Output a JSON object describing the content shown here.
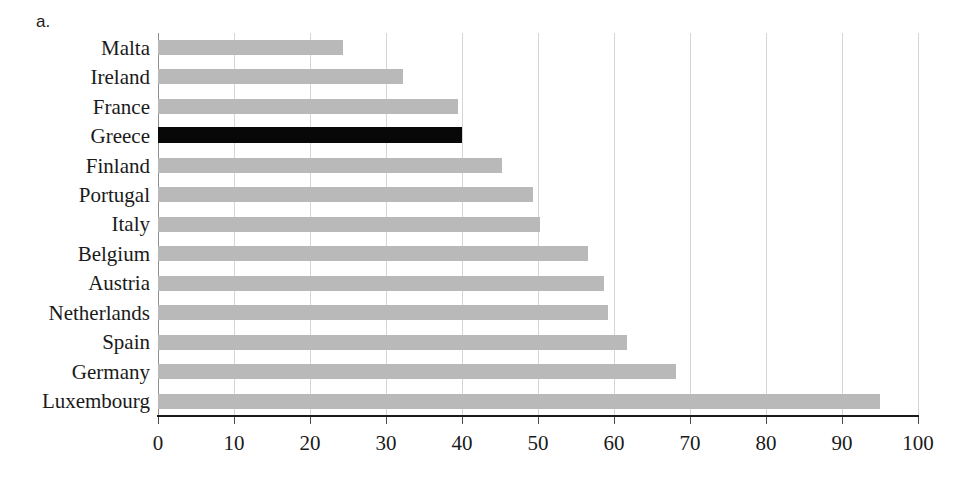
{
  "panel": {
    "label": "a."
  },
  "chart_data": {
    "type": "bar",
    "orientation": "horizontal",
    "title": "",
    "subtitle": "",
    "xlabel": "",
    "ylabel": "",
    "xlim": [
      0,
      100
    ],
    "xticks": [
      0,
      10,
      20,
      30,
      40,
      50,
      60,
      70,
      80,
      90,
      100
    ],
    "xtick_labels": [
      "0",
      "10",
      "20",
      "30",
      "40",
      "50",
      "60",
      "70",
      "80",
      "90",
      "100"
    ],
    "grid": "vertical",
    "legend": "none",
    "bar_color": "#b9b9b9",
    "highlight_color": "#080808",
    "highlight_category": "Greece",
    "categories": [
      "Malta",
      "Ireland",
      "France",
      "Greece",
      "Finland",
      "Portugal",
      "Italy",
      "Belgium",
      "Austria",
      "Netherlands",
      "Spain",
      "Germany",
      "Luxembourg"
    ],
    "values": [
      24.4,
      32.2,
      39.5,
      40.0,
      45.2,
      49.3,
      50.2,
      56.6,
      58.7,
      59.2,
      61.7,
      68.2,
      95.0
    ],
    "bars": [
      {
        "category": "Malta",
        "value": 24.4,
        "highlight": false
      },
      {
        "category": "Ireland",
        "value": 32.2,
        "highlight": false
      },
      {
        "category": "France",
        "value": 39.5,
        "highlight": false
      },
      {
        "category": "Greece",
        "value": 40.0,
        "highlight": true
      },
      {
        "category": "Finland",
        "value": 45.2,
        "highlight": false
      },
      {
        "category": "Portugal",
        "value": 49.3,
        "highlight": false
      },
      {
        "category": "Italy",
        "value": 50.2,
        "highlight": false
      },
      {
        "category": "Belgium",
        "value": 56.6,
        "highlight": false
      },
      {
        "category": "Austria",
        "value": 58.7,
        "highlight": false
      },
      {
        "category": "Netherlands",
        "value": 59.2,
        "highlight": false
      },
      {
        "category": "Spain",
        "value": 61.7,
        "highlight": false
      },
      {
        "category": "Germany",
        "value": 68.2,
        "highlight": false
      },
      {
        "category": "Luxembourg",
        "value": 95.0,
        "highlight": false
      }
    ]
  }
}
